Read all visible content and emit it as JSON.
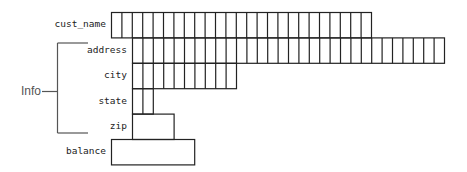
{
  "diagram": {
    "type": "record-layout",
    "cell_width": 10.4,
    "row_height": 25.4,
    "line_color": "#222222",
    "bracket_color": "#555555",
    "fields": [
      {
        "name": "cust_name",
        "label": "cust_name",
        "cells": 25,
        "x": 111,
        "subdivided": true,
        "grouped": false
      },
      {
        "name": "address",
        "label": "address",
        "cells": 30,
        "x": 132,
        "subdivided": true,
        "grouped": true
      },
      {
        "name": "city",
        "label": "city",
        "cells": 10,
        "x": 132,
        "subdivided": true,
        "grouped": true
      },
      {
        "name": "state",
        "label": "state",
        "cells": 2,
        "x": 132,
        "subdivided": true,
        "grouped": true
      },
      {
        "name": "zip",
        "label": "zip",
        "cells": 4,
        "x": 132,
        "subdivided": false,
        "grouped": true
      },
      {
        "name": "balance",
        "label": "balance",
        "cells": 8,
        "x": 111,
        "subdivided": false,
        "grouped": false
      }
    ],
    "group": {
      "label": "Info",
      "members": [
        "address",
        "city",
        "state",
        "zip"
      ]
    }
  }
}
